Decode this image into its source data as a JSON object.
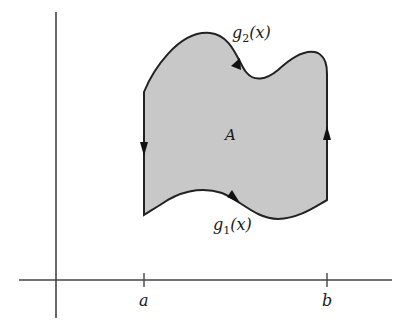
{
  "diagram": {
    "region_label": "A",
    "upper_curve_label": {
      "fn": "g",
      "sub": "2",
      "arg": "(x)"
    },
    "lower_curve_label": {
      "fn": "g",
      "sub": "1",
      "arg": "(x)"
    },
    "x_ticks": [
      "a",
      "b"
    ],
    "colors": {
      "fill": "#c8c8c8",
      "stroke": "#222222",
      "axis": "#444444"
    },
    "orientation": "counterclockwise boundary arrows"
  }
}
